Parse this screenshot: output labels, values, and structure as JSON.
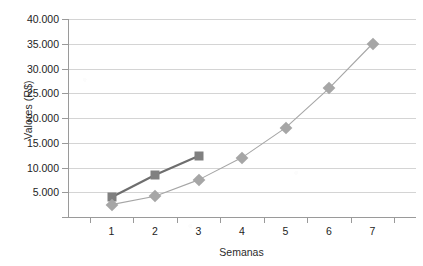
{
  "chart_data": {
    "type": "line",
    "title": "",
    "xlabel": "Semanas",
    "ylabel": "Valores (R$)",
    "categories": [
      "1",
      "2",
      "3",
      "4",
      "5",
      "6",
      "7"
    ],
    "x": [
      1,
      2,
      3,
      4,
      5,
      6,
      7
    ],
    "ylim": [
      0,
      40000
    ],
    "ytick_values": [
      0,
      5000,
      10000,
      15000,
      20000,
      25000,
      30000,
      35000,
      40000
    ],
    "ytick_labels": [
      "",
      "5.000",
      "10.000",
      "15.000",
      "20.000",
      "25.000",
      "30.000",
      "35.000",
      "40.000"
    ],
    "grid": "horizontal",
    "legend": "none",
    "series": [
      {
        "name": "serie-quadrados",
        "marker": "square",
        "color": "#808080",
        "line_color": "#6e6e6e",
        "line_width": 2.2,
        "x": [
          1,
          2,
          3
        ],
        "values": [
          4000,
          8500,
          12300
        ]
      },
      {
        "name": "serie-losangos",
        "marker": "diamond",
        "color": "#a6a6a6",
        "line_color": "#a6a6a6",
        "line_width": 1.1,
        "x": [
          1,
          2,
          3,
          4,
          5,
          6,
          7
        ],
        "values": [
          2500,
          4200,
          7500,
          12000,
          18000,
          26000,
          35000
        ]
      }
    ]
  },
  "colors": {
    "axis": "#9a9a9a",
    "grid": "#d4d4d4",
    "text": "#1d1d1d",
    "background": "#ffffff"
  }
}
